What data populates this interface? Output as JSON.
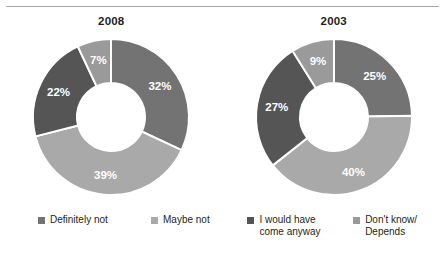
{
  "chart_data": {
    "type": "pie",
    "title": "",
    "subtitle": "",
    "xlabel": "",
    "ylabel": "",
    "variant": "donut",
    "legend_position": "bottom",
    "grid": false,
    "categories": [
      "Definitely not",
      "Maybe not",
      "I would have come anyway",
      "Don't know/Depends"
    ],
    "colors": [
      "#737373",
      "#a9a9a9",
      "#555555",
      "#9a9a9a"
    ],
    "unit": "%",
    "charts": [
      {
        "title": "2008",
        "slices": [
          {
            "label": "Definitely not",
            "value": 32,
            "display": "32%",
            "color": "#737373"
          },
          {
            "label": "Maybe not",
            "value": 39,
            "display": "39%",
            "color": "#a9a9a9"
          },
          {
            "label": "I would have come anyway",
            "value": 22,
            "display": "22%",
            "color": "#555555"
          },
          {
            "label": "Don't know/Depends",
            "value": 7,
            "display": "7%",
            "color": "#9a9a9a"
          }
        ]
      },
      {
        "title": "2003",
        "slices": [
          {
            "label": "Definitely not",
            "value": 25,
            "display": "25%",
            "color": "#737373"
          },
          {
            "label": "Maybe not",
            "value": 40,
            "display": "40%",
            "color": "#a9a9a9"
          },
          {
            "label": "I would have come anyway",
            "value": 27,
            "display": "27%",
            "color": "#555555"
          },
          {
            "label": "Don't know/Depends",
            "value": 9,
            "display": "9%",
            "color": "#9a9a9a"
          }
        ]
      }
    ],
    "series": [
      {
        "name": "2008",
        "values": [
          32,
          39,
          22,
          7
        ]
      },
      {
        "name": "2003",
        "values": [
          25,
          40,
          27,
          9
        ]
      }
    ]
  },
  "legend": {
    "items": [
      {
        "label": "Definitely not",
        "color": "#737373"
      },
      {
        "label": "Maybe not",
        "color": "#a9a9a9"
      },
      {
        "label": "I would have\ncome anyway",
        "color": "#555555"
      },
      {
        "label": "Don't know/\nDepends",
        "color": "#9a9a9a"
      }
    ]
  },
  "style": {
    "rule_color": "#a6a6a6",
    "background": "#ffffff",
    "label_text_color": "#ffffff",
    "title_text_color": "#231f20"
  }
}
